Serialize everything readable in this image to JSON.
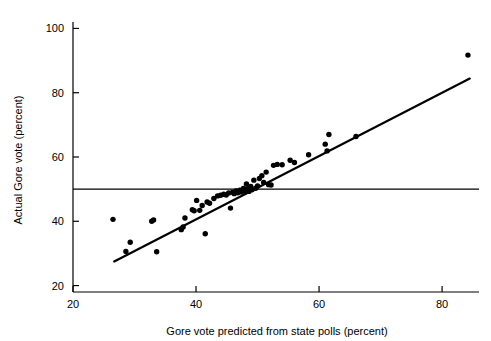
{
  "chart_data": {
    "type": "scatter",
    "title": "",
    "xlabel": "Gore vote predicted from state polls (percent)",
    "ylabel": "Actual Gore vote (percent)",
    "xlim": [
      20,
      86
    ],
    "ylim": [
      18,
      102
    ],
    "xticks": [
      20,
      40,
      60,
      80
    ],
    "yticks": [
      20,
      40,
      60,
      80,
      100
    ],
    "xtick_labels": [
      "20",
      "40",
      "60",
      "80"
    ],
    "ytick_labels": [
      "20",
      "40",
      "60",
      "80",
      "100"
    ],
    "grid": false,
    "legend": "none",
    "series": [
      {
        "name": "States",
        "marker": "filled-circle",
        "color": "#000000",
        "points": [
          [
            26.5,
            40.6
          ],
          [
            28.6,
            30.6
          ],
          [
            29.3,
            33.5
          ],
          [
            32.8,
            40.0
          ],
          [
            33.1,
            40.4
          ],
          [
            33.6,
            30.5
          ],
          [
            37.6,
            37.4
          ],
          [
            37.9,
            38.2
          ],
          [
            38.2,
            41.0
          ],
          [
            39.4,
            43.6
          ],
          [
            39.7,
            43.3
          ],
          [
            40.1,
            46.5
          ],
          [
            40.6,
            43.4
          ],
          [
            41.0,
            44.9
          ],
          [
            41.5,
            36.1
          ],
          [
            41.8,
            46.0
          ],
          [
            42.2,
            45.6
          ],
          [
            42.9,
            47.1
          ],
          [
            43.5,
            47.9
          ],
          [
            44.0,
            48.1
          ],
          [
            44.5,
            48.4
          ],
          [
            44.9,
            48.2
          ],
          [
            45.3,
            48.8
          ],
          [
            45.6,
            44.1
          ],
          [
            45.9,
            49.0
          ],
          [
            46.2,
            48.6
          ],
          [
            46.5,
            49.4
          ],
          [
            46.8,
            48.9
          ],
          [
            47.1,
            49.7
          ],
          [
            47.4,
            49.1
          ],
          [
            47.7,
            50.2
          ],
          [
            47.9,
            49.5
          ],
          [
            48.2,
            51.6
          ],
          [
            48.4,
            50.1
          ],
          [
            48.6,
            49.3
          ],
          [
            48.9,
            50.8
          ],
          [
            49.1,
            49.8
          ],
          [
            49.4,
            52.8
          ],
          [
            49.7,
            50.3
          ],
          [
            50.0,
            51.0
          ],
          [
            50.3,
            53.3
          ],
          [
            50.7,
            54.2
          ],
          [
            51.0,
            52.1
          ],
          [
            51.4,
            55.3
          ],
          [
            51.8,
            51.4
          ],
          [
            52.2,
            51.3
          ],
          [
            52.6,
            57.4
          ],
          [
            53.2,
            57.7
          ],
          [
            54.0,
            57.6
          ],
          [
            55.3,
            59.0
          ],
          [
            56.0,
            58.3
          ],
          [
            58.3,
            60.7
          ],
          [
            61.0,
            64.0
          ],
          [
            61.3,
            61.9
          ],
          [
            61.6,
            67.0
          ],
          [
            66.0,
            66.4
          ],
          [
            84.2,
            91.7
          ]
        ]
      }
    ],
    "annotations": [
      {
        "kind": "regression-line",
        "name": "fitted-regression-line",
        "x0": 26.7,
        "y0": 27.5,
        "x1": 84.5,
        "y1": 84.4
      },
      {
        "kind": "reference-line",
        "name": "fifty-percent-reference-line",
        "orientation": "horizontal",
        "value": 50
      }
    ]
  }
}
